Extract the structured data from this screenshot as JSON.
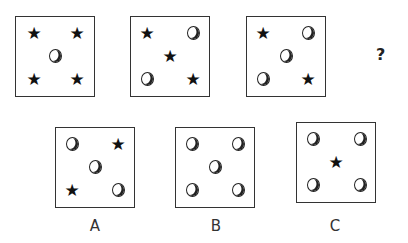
{
  "puzzle": {
    "question_mark": "?",
    "sequence": [
      {
        "id": 1,
        "tl": "star",
        "tr": "star",
        "c": "circle",
        "bl": "star",
        "br": "star"
      },
      {
        "id": 2,
        "tl": "star",
        "tr": "circle",
        "c": "star",
        "bl": "circle",
        "br": "star"
      },
      {
        "id": 3,
        "tl": "star",
        "tr": "circle",
        "c": "circle",
        "bl": "circle",
        "br": "star"
      }
    ],
    "options": [
      {
        "label": "A",
        "tl": "circle",
        "tr": "star",
        "c": "circle",
        "bl": "star",
        "br": "circle"
      },
      {
        "label": "B",
        "tl": "circle",
        "tr": "circle",
        "c": "circle",
        "bl": "circle",
        "br": "circle"
      },
      {
        "label": "C",
        "tl": "circle",
        "tr": "circle",
        "c": "star",
        "bl": "circle",
        "br": "circle"
      }
    ]
  }
}
